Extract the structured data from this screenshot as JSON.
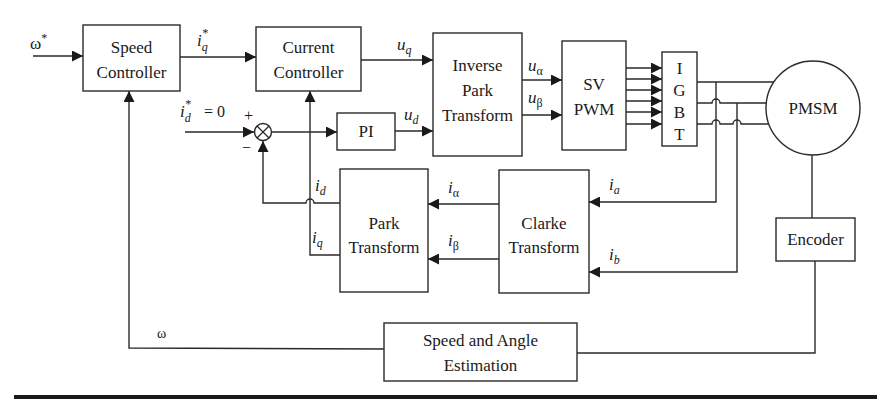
{
  "diagram": {
    "colors": {
      "line": "#2a2a2a",
      "text": "#1a1a1a",
      "background": "#ffffff"
    },
    "blocks": {
      "speed_controller": {
        "line1": "Speed",
        "line2": "Controller"
      },
      "current_controller": {
        "line1": "Current",
        "line2": "Controller"
      },
      "pi": {
        "label": "PI"
      },
      "inverse_park": {
        "line1": "Inverse",
        "line2": "Park",
        "line3": "Transform"
      },
      "sv_pwm": {
        "line1": "SV",
        "line2": "PWM"
      },
      "igbt": {
        "letters": [
          "I",
          "G",
          "B",
          "T"
        ]
      },
      "pmsm": {
        "label": "PMSM"
      },
      "encoder": {
        "label": "Encoder"
      },
      "park": {
        "line1": "Park",
        "line2": "Transform"
      },
      "clarke": {
        "line1": "Clarke",
        "line2": "Transform"
      },
      "speed_angle": {
        "line1": "Speed and Angle",
        "line2": "Estimation"
      }
    },
    "signals": {
      "omega_ref": {
        "base": "ω",
        "sup": "*"
      },
      "iq_ref": {
        "base": "i",
        "sub": "q",
        "sup": "*"
      },
      "id_ref": {
        "base": "i",
        "sub": "d",
        "sup": "*",
        "suffix": "= 0"
      },
      "sum_plus": "+",
      "sum_minus": "−",
      "uq": {
        "base": "u",
        "sub": "q"
      },
      "ud": {
        "base": "u",
        "sub": "d"
      },
      "u_alpha": {
        "base": "u",
        "sub": "α"
      },
      "u_beta": {
        "base": "u",
        "sub": "β"
      },
      "id": {
        "base": "i",
        "sub": "d"
      },
      "iq": {
        "base": "i",
        "sub": "q"
      },
      "i_alpha": {
        "base": "i",
        "sub": "α"
      },
      "i_beta": {
        "base": "i",
        "sub": "β"
      },
      "ia": {
        "base": "i",
        "sub": "a"
      },
      "ib": {
        "base": "i",
        "sub": "b"
      },
      "omega_fb": "ω"
    }
  }
}
